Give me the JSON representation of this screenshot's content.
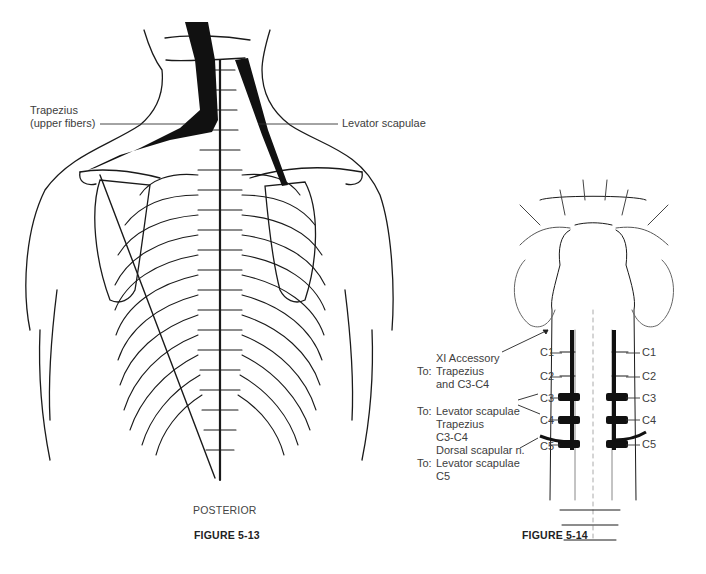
{
  "figure_left": {
    "caption": "FIGURE 5-13",
    "view": "POSTERIOR",
    "labels": {
      "trapezius_line1": "Trapezius",
      "trapezius_line2": "(upper fibers)",
      "levator": "Levator scapulae"
    }
  },
  "figure_right": {
    "caption": "FIGURE 5-14",
    "annotations": {
      "accessory_line1": "XI Accessory",
      "accessory_to": "To:",
      "accessory_line2": "Trapezius",
      "accessory_line3": "and C3-C4",
      "cervical_to": "To:",
      "cervical_line1": "Levator scapulae",
      "cervical_line2": "Trapezius",
      "cervical_line3": "C3-C4",
      "dorsal_line1": "Dorsal scapular n.",
      "dorsal_to": "To:",
      "dorsal_line2": "Levator scapulae",
      "dorsal_line3": "C5"
    },
    "levels_left": [
      "C1",
      "C2",
      "C3",
      "C4",
      "C5"
    ],
    "levels_right": [
      "C1",
      "C2",
      "C3",
      "C4",
      "C5"
    ]
  },
  "colors": {
    "ink": "#1a1a1a",
    "muscle": "#111111",
    "stipple": "#9a9a9a"
  }
}
